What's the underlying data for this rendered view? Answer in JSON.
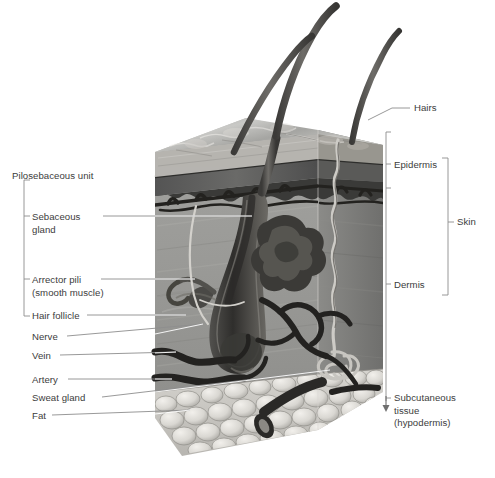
{
  "figure": {
    "type": "anatomical-cross-section",
    "text_color": "#3c3c3c",
    "background_color": "#ffffff",
    "leader_line_color_on_white": "#8a8a8a",
    "leader_line_color_on_art": "#ffffff"
  },
  "labels_left": [
    {
      "key": "pilosebaceous_unit",
      "text": "Pilosebaceous unit",
      "lines": [
        "Pilosebaceous unit"
      ],
      "x": 12,
      "y": 170,
      "bracket": true
    },
    {
      "key": "sebaceous_gland",
      "text": "Sebaceous gland",
      "lines": [
        "Sebaceous",
        "gland"
      ],
      "x": 32,
      "y": 211,
      "leader_y": 216
    },
    {
      "key": "arrector_pili",
      "text": "Arrector pili (smooth muscle)",
      "lines": [
        "Arrector pili",
        "(smooth muscle)"
      ],
      "x": 32,
      "y": 274,
      "leader_y": 279
    },
    {
      "key": "hair_follicle",
      "text": "Hair follicle",
      "lines": [
        "Hair follicle"
      ],
      "x": 32,
      "y": 310,
      "leader_y": 315
    },
    {
      "key": "nerve",
      "text": "Nerve",
      "lines": [
        "Nerve"
      ],
      "x": 32,
      "y": 331,
      "leader_y": 336
    },
    {
      "key": "vein",
      "text": "Vein",
      "lines": [
        "Vein"
      ],
      "x": 32,
      "y": 350,
      "leader_y": 355
    },
    {
      "key": "artery",
      "text": "Artery",
      "lines": [
        "Artery"
      ],
      "x": 32,
      "y": 374,
      "leader_y": 379
    },
    {
      "key": "sweat_gland",
      "text": "Sweat gland",
      "lines": [
        "Sweat gland"
      ],
      "x": 32,
      "y": 392,
      "leader_y": 397
    },
    {
      "key": "fat",
      "text": "Fat",
      "lines": [
        "Fat"
      ],
      "x": 32,
      "y": 410,
      "leader_y": 415
    }
  ],
  "labels_right": [
    {
      "key": "hairs",
      "text": "Hairs",
      "lines": [
        "Hairs"
      ],
      "x": 414,
      "y": 102
    },
    {
      "key": "epidermis",
      "text": "Epidermis",
      "lines": [
        "Epidermis"
      ],
      "x": 394,
      "y": 159
    },
    {
      "key": "dermis",
      "text": "Dermis",
      "lines": [
        "Dermis"
      ],
      "x": 394,
      "y": 279
    },
    {
      "key": "skin",
      "text": "Skin",
      "lines": [
        "Skin"
      ],
      "x": 457,
      "y": 216
    },
    {
      "key": "subcutaneous_tissue",
      "text": "Subcutaneous tissue (hypodermis)",
      "lines": [
        "Subcutaneous",
        "tissue",
        "(hypodermis)"
      ],
      "x": 394,
      "y": 392
    }
  ],
  "brackets": {
    "pilosebaceous": {
      "x": 24,
      "top": 180,
      "bottom": 316,
      "ticks": [
        216,
        279,
        316
      ]
    },
    "layers": {
      "x": 386,
      "top": 132,
      "bottom": 401,
      "ticks": [
        164,
        188,
        284,
        398
      ]
    },
    "skin": {
      "x": 448,
      "top": 158,
      "bottom": 295,
      "tick": 222
    }
  },
  "structures": [
    {
      "name": "hair-shaft",
      "count": 3,
      "description": "three curved hair shafts emerging above the skin surface"
    },
    {
      "name": "epidermis-surface",
      "description": "scaly keratinised top surface of the block"
    },
    {
      "name": "stratum-corneum",
      "description": "dark granular band beneath surface"
    },
    {
      "name": "basal-layer",
      "description": "wavy dark dermo-epidermal junction"
    },
    {
      "name": "dermis",
      "description": "thick fibrous mid layer"
    },
    {
      "name": "sebaceous-gland",
      "description": "lobulated gland opening into the follicle"
    },
    {
      "name": "arrector-pili-muscle",
      "description": "small muscle running from follicle to epidermis"
    },
    {
      "name": "hair-follicle",
      "description": "deep follicle with bulb in lower dermis"
    },
    {
      "name": "nerve",
      "description": "pale nerve fibre running to follicle"
    },
    {
      "name": "vein",
      "description": "dark vessel at dermis base"
    },
    {
      "name": "artery",
      "description": "dark vessel at dermis base"
    },
    {
      "name": "sweat-duct",
      "description": "spiral duct from surface to coiled gland"
    },
    {
      "name": "sweat-gland",
      "description": "coiled gland at dermis/hypodermis border"
    },
    {
      "name": "subcutaneous-fat",
      "description": "rounded fat lobules forming base of the block"
    }
  ]
}
